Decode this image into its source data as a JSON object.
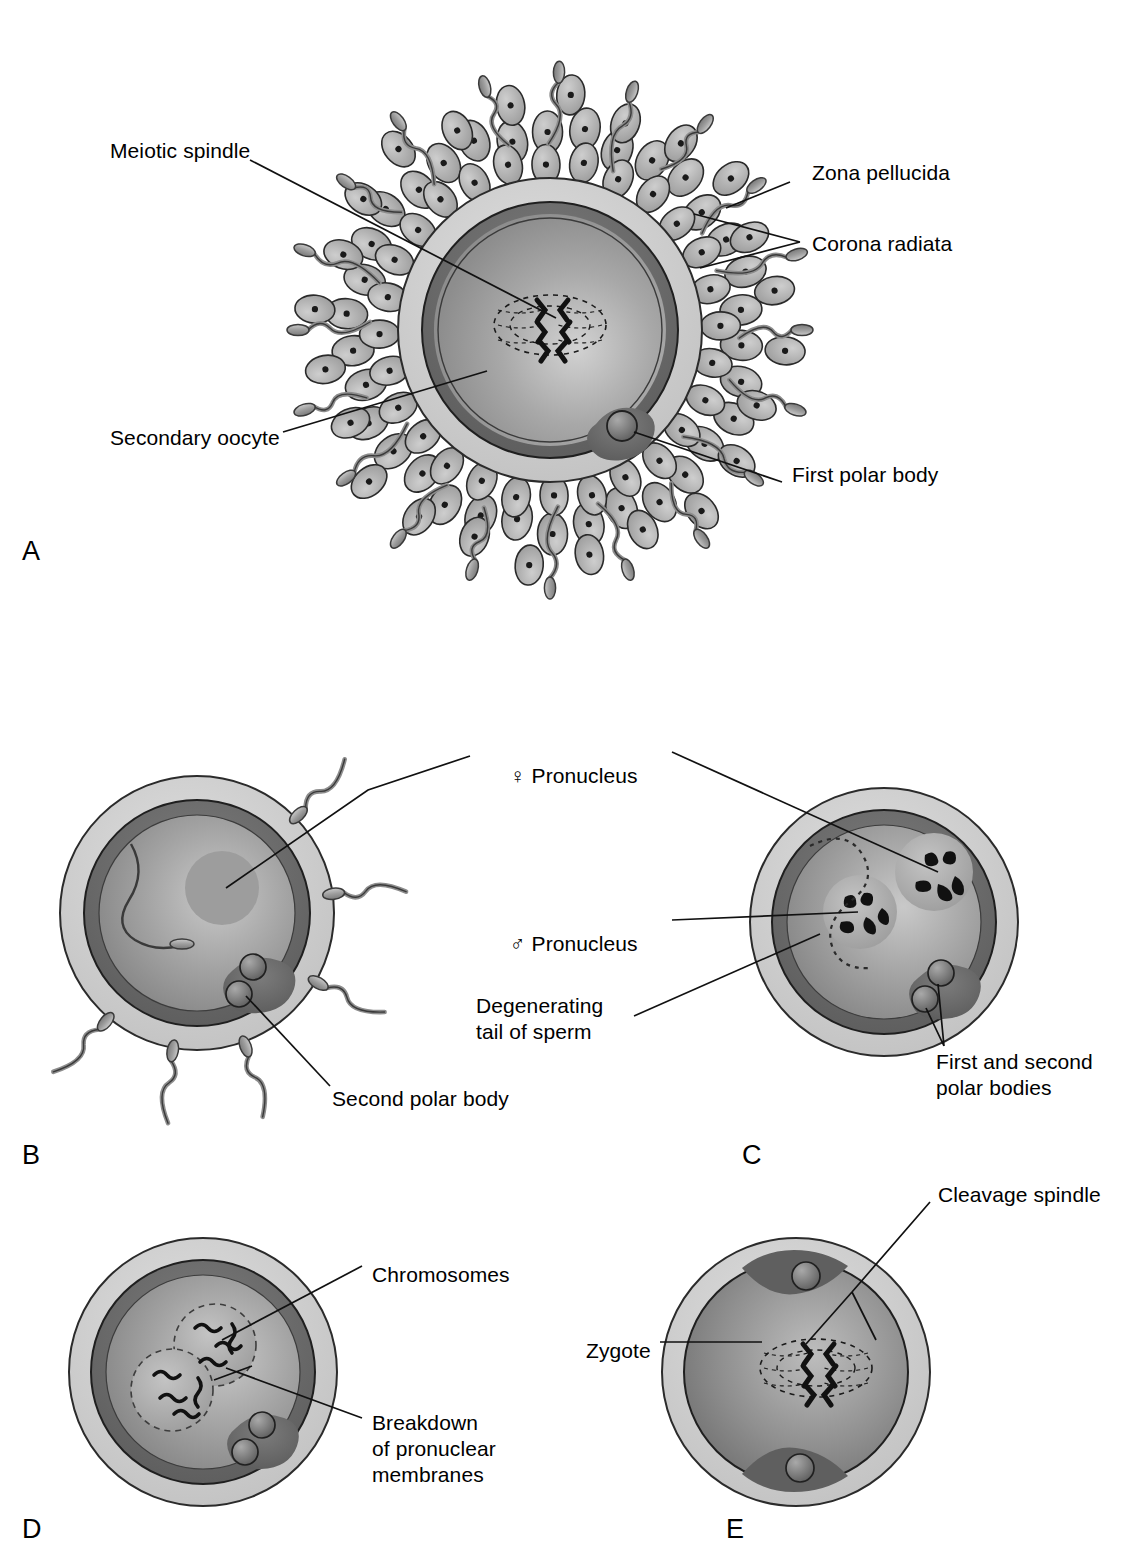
{
  "figure": {
    "background": "#ffffff",
    "ink": "#000000"
  },
  "palette": {
    "zona_pellucida": "#cfcfcf",
    "cytoplasm_rim": "#6f6f6f",
    "cytoplasm_inner": "#9a9a9a",
    "corona_cell": "#b9b9b9",
    "sperm": "#a6a6a6",
    "chromosome": "#101010",
    "outline": "#111111",
    "polar_body": "#7d7d7d",
    "pronucleus": "#b0b0b0"
  },
  "panels": [
    {
      "id": "A",
      "letter": "A",
      "letter_pos": {
        "x": 22,
        "y": 538
      },
      "caption": "Secondary oocyte surrounded by corona radiata and many sperm",
      "labels": [
        {
          "key": "meiotic-spindle",
          "text": "Meiotic spindle",
          "x": 110,
          "y": 150,
          "anchor": "start"
        },
        {
          "key": "zona-pellucida",
          "text": "Zona pellucida",
          "x": 812,
          "y": 170,
          "anchor": "start"
        },
        {
          "key": "corona-radiata",
          "text": "Corona radiata",
          "x": 812,
          "y": 242,
          "anchor": "start"
        },
        {
          "key": "secondary-oocyte",
          "text": "Secondary oocyte",
          "x": 110,
          "y": 437,
          "anchor": "start"
        },
        {
          "key": "first-polar-body",
          "text": "First polar body",
          "x": 792,
          "y": 474,
          "anchor": "start"
        }
      ]
    },
    {
      "id": "B",
      "letter": "B",
      "letter_pos": {
        "x": 22,
        "y": 1142
      },
      "caption": "Sperm has entered oocyte; female pronucleus and second polar body visible",
      "labels": [
        {
          "key": "female-pronucleus",
          "text": "Pronucleus",
          "symbol": "♀",
          "x": 486,
          "y": 748,
          "anchor": "start"
        },
        {
          "key": "second-polar-body",
          "text": "Second polar body",
          "x": 332,
          "y": 1097,
          "anchor": "start"
        }
      ]
    },
    {
      "id": "C",
      "letter": "C",
      "letter_pos": {
        "x": 742,
        "y": 1142
      },
      "caption": "Male and female pronuclei with chromosomes; degenerating sperm tail",
      "labels": [
        {
          "key": "male-pronucleus",
          "text": "Pronucleus",
          "symbol": "♂",
          "x": 486,
          "y": 914,
          "anchor": "start"
        },
        {
          "key": "degenerating-tail-of-sperm",
          "text": "Degenerating\ntail of sperm",
          "x": 476,
          "y": 1003,
          "anchor": "start"
        },
        {
          "key": "first-and-second-polar-bodies",
          "text": "First and second\npolar bodies",
          "x": 936,
          "y": 1059,
          "anchor": "start"
        }
      ]
    },
    {
      "id": "D",
      "letter": "D",
      "letter_pos": {
        "x": 22,
        "y": 1516
      },
      "caption": "Breakdown of pronuclear membranes; chromosomes intermingle",
      "labels": [
        {
          "key": "chromosomes",
          "text": "Chromosomes",
          "x": 372,
          "y": 1273,
          "anchor": "start"
        },
        {
          "key": "breakdown-of-pronuclear-membranes",
          "text": "Breakdown\nof pronuclear\nmembranes",
          "x": 372,
          "y": 1421,
          "anchor": "start"
        }
      ]
    },
    {
      "id": "E",
      "letter": "E",
      "letter_pos": {
        "x": 726,
        "y": 1516
      },
      "caption": "Zygote with cleavage spindle and two polar bodies",
      "labels": [
        {
          "key": "cleavage-spindle",
          "text": "Cleavage spindle",
          "x": 938,
          "y": 1192,
          "anchor": "start"
        },
        {
          "key": "zygote",
          "text": "Zygote",
          "x": 586,
          "y": 1349,
          "anchor": "start"
        }
      ]
    }
  ],
  "label_text": {
    "meiotic_spindle": "Meiotic spindle",
    "zona_pellucida": "Zona pellucida",
    "corona_radiata": "Corona radiata",
    "secondary_oocyte": "Secondary oocyte",
    "first_polar_body": "First polar body",
    "pronucleus": "Pronucleus",
    "female_symbol": "♀",
    "male_symbol": "♂",
    "second_polar_body": "Second polar body",
    "degenerating_tail_line1": "Degenerating",
    "degenerating_tail_line2": "tail of sperm",
    "first_second_polar_line1": "First and second",
    "first_second_polar_line2": "polar bodies",
    "chromosomes": "Chromosomes",
    "breakdown_line1": "Breakdown",
    "breakdown_line2": "of pronuclear",
    "breakdown_line3": "membranes",
    "cleavage_spindle": "Cleavage spindle",
    "zygote": "Zygote",
    "letter_a": "A",
    "letter_b": "B",
    "letter_c": "C",
    "letter_d": "D",
    "letter_e": "E"
  }
}
